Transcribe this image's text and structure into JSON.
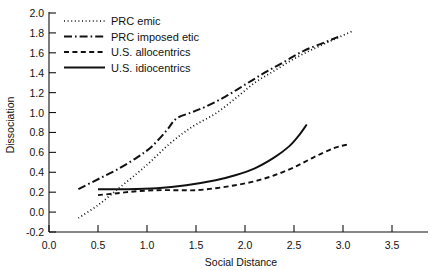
{
  "chart_data": {
    "type": "line",
    "title": "",
    "xlabel": "Social Distance",
    "ylabel": "Dissociation",
    "xlim": [
      0.0,
      3.5
    ],
    "ylim": [
      -0.2,
      2.0
    ],
    "grid": false,
    "legend_position": "top-left",
    "xticks": [
      "0.0",
      "0.5",
      "1.0",
      "1.5",
      "2.0",
      "2.5",
      "3.0",
      "3.5"
    ],
    "xtick_values": [
      0.0,
      0.5,
      1.0,
      1.5,
      2.0,
      2.5,
      3.0,
      3.5
    ],
    "yticks": [
      "-0.2",
      "0.0",
      "0.2",
      "0.4",
      "0.6",
      "0.8",
      "1.0",
      "1.2",
      "1.4",
      "1.6",
      "1.8",
      "2.0"
    ],
    "ytick_values": [
      -0.2,
      0.0,
      0.2,
      0.4,
      0.6,
      0.8,
      1.0,
      1.2,
      1.4,
      1.6,
      1.8,
      2.0
    ],
    "series": [
      {
        "name": "PRC emic",
        "style": "dotted",
        "points": [
          [
            0.3,
            -0.06
          ],
          [
            0.5,
            0.07
          ],
          [
            0.7,
            0.23
          ],
          [
            0.9,
            0.39
          ],
          [
            1.05,
            0.52
          ],
          [
            1.2,
            0.66
          ],
          [
            1.35,
            0.78
          ],
          [
            1.5,
            0.88
          ],
          [
            1.7,
            0.99
          ],
          [
            1.9,
            1.14
          ],
          [
            2.1,
            1.3
          ],
          [
            2.3,
            1.42
          ],
          [
            2.5,
            1.54
          ],
          [
            2.7,
            1.64
          ],
          [
            2.9,
            1.73
          ],
          [
            3.1,
            1.82
          ]
        ]
      },
      {
        "name": "PRC imposed etic",
        "style": "dash-dot",
        "points": [
          [
            0.3,
            0.23
          ],
          [
            0.5,
            0.33
          ],
          [
            0.7,
            0.43
          ],
          [
            0.9,
            0.55
          ],
          [
            1.05,
            0.66
          ],
          [
            1.2,
            0.82
          ],
          [
            1.3,
            0.94
          ],
          [
            1.45,
            1.0
          ],
          [
            1.6,
            1.06
          ],
          [
            1.8,
            1.16
          ],
          [
            2.0,
            1.28
          ],
          [
            2.2,
            1.4
          ],
          [
            2.4,
            1.51
          ],
          [
            2.6,
            1.62
          ],
          [
            2.8,
            1.7
          ],
          [
            2.95,
            1.76
          ]
        ]
      },
      {
        "name": "U.S. allocentrics",
        "style": "dashed",
        "points": [
          [
            0.5,
            0.17
          ],
          [
            0.7,
            0.19
          ],
          [
            0.9,
            0.21
          ],
          [
            1.1,
            0.22
          ],
          [
            1.3,
            0.22
          ],
          [
            1.5,
            0.22
          ],
          [
            1.7,
            0.24
          ],
          [
            1.9,
            0.27
          ],
          [
            2.1,
            0.31
          ],
          [
            2.3,
            0.37
          ],
          [
            2.5,
            0.45
          ],
          [
            2.7,
            0.55
          ],
          [
            2.9,
            0.64
          ],
          [
            3.05,
            0.68
          ]
        ]
      },
      {
        "name": "U.S. idiocentrics",
        "style": "solid",
        "points": [
          [
            0.5,
            0.23
          ],
          [
            0.8,
            0.23
          ],
          [
            1.1,
            0.24
          ],
          [
            1.4,
            0.27
          ],
          [
            1.7,
            0.32
          ],
          [
            1.9,
            0.37
          ],
          [
            2.1,
            0.44
          ],
          [
            2.3,
            0.55
          ],
          [
            2.45,
            0.66
          ],
          [
            2.55,
            0.77
          ],
          [
            2.63,
            0.88
          ]
        ]
      }
    ]
  }
}
